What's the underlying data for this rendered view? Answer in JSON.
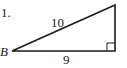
{
  "problem": {
    "number": "1.",
    "vertex_label": "B",
    "hypotenuse_label": "10",
    "base_label": "9"
  },
  "colors": {
    "stroke": "#1a1a1a",
    "text": "#222222",
    "background": "#ffffff"
  }
}
